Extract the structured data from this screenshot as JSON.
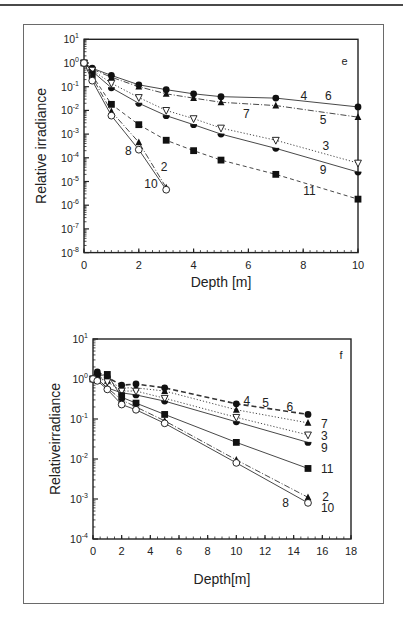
{
  "figure": {
    "panels": [
      "e",
      "f"
    ]
  },
  "chart_data": [
    {
      "type": "line",
      "panel_label": "e",
      "title": "",
      "xlabel": "Depth [m]",
      "ylabel": "Relative irradiance",
      "xlim": [
        0,
        10
      ],
      "ylim": [
        1e-08,
        10
      ],
      "yscale": "log",
      "x_ticks": [
        "0",
        "2",
        "4",
        "6",
        "8",
        "10"
      ],
      "y_ticks": [
        "10^1",
        "10^0",
        "10^-1",
        "10^-2",
        "10^-3",
        "10^-4",
        "10^-5",
        "10^-6",
        "10^-7",
        "10^-8"
      ],
      "grid": false,
      "legend": "inline curve numbers",
      "series": [
        {
          "name": "4, 6",
          "marker": "filled-circle",
          "line": "solid",
          "x": [
            0,
            0.3,
            1,
            2,
            3,
            4,
            5,
            7,
            10
          ],
          "values": [
            1,
            0.6,
            0.3,
            0.12,
            0.075,
            0.05,
            0.038,
            0.033,
            0.014
          ]
        },
        {
          "name": "5, 7",
          "marker": "filled-triangle",
          "line": "dash-dot",
          "x": [
            0,
            0.3,
            1,
            2,
            3,
            4,
            5,
            7,
            10
          ],
          "values": [
            1,
            0.55,
            0.25,
            0.1,
            0.05,
            0.033,
            0.022,
            0.016,
            0.0052
          ]
        },
        {
          "name": "3",
          "marker": "open-triangle-down",
          "line": "dotted",
          "x": [
            0,
            0.3,
            1,
            2,
            3,
            4,
            5,
            7,
            10
          ],
          "values": [
            1,
            0.5,
            0.14,
            0.035,
            0.01,
            0.0045,
            0.0018,
            0.00055,
            6e-05
          ]
        },
        {
          "name": "9",
          "marker": "half-filled-circle",
          "line": "solid",
          "x": [
            0,
            0.3,
            1,
            2,
            3,
            4,
            5,
            7,
            10
          ],
          "values": [
            1,
            0.45,
            0.09,
            0.02,
            0.006,
            0.0025,
            0.001,
            0.00025,
            2.5e-05
          ]
        },
        {
          "name": "11",
          "marker": "filled-square",
          "line": "dashed",
          "x": [
            0,
            0.3,
            1,
            2,
            3,
            4,
            5,
            7,
            10
          ],
          "values": [
            1,
            0.3,
            0.018,
            0.0025,
            0.00055,
            0.0002,
            8e-05,
            2e-05,
            1.8e-06
          ]
        },
        {
          "name": "8, 2",
          "marker": "filled-triangle",
          "line": "dash-dot",
          "x": [
            0,
            0.3,
            1,
            2,
            3
          ],
          "values": [
            1,
            0.25,
            0.009,
            0.00045,
            5.5e-06
          ]
        },
        {
          "name": "10",
          "marker": "open-circle",
          "line": "solid",
          "x": [
            0,
            0.3,
            1,
            2,
            3
          ],
          "values": [
            1,
            0.18,
            0.006,
            0.00022,
            4.5e-06
          ]
        }
      ],
      "annotations": [
        {
          "text": "e",
          "x": 9.4,
          "y": 1.2
        },
        {
          "text": "4",
          "x": 7.9,
          "y": 0.04
        },
        {
          "text": "6",
          "x": 8.8,
          "y": 0.04
        },
        {
          "text": "7",
          "x": 5.8,
          "y": 0.007
        },
        {
          "text": "5",
          "x": 8.6,
          "y": 0.004
        },
        {
          "text": "3",
          "x": 8.7,
          "y": 0.0003
        },
        {
          "text": "9",
          "x": 8.6,
          "y": 3e-05
        },
        {
          "text": "11",
          "x": 8.0,
          "y": 4e-06
        },
        {
          "text": "8",
          "x": 1.5,
          "y": 0.0002
        },
        {
          "text": "2",
          "x": 2.8,
          "y": 4e-05
        },
        {
          "text": "10",
          "x": 2.2,
          "y": 8e-06
        }
      ]
    },
    {
      "type": "line",
      "panel_label": "f",
      "title": "",
      "xlabel": "Depth[m]",
      "ylabel": "Relativeirradiance",
      "xlim": [
        0,
        18
      ],
      "ylim": [
        0.0001,
        10
      ],
      "yscale": "log",
      "x_ticks": [
        "0",
        "2",
        "4",
        "6",
        "8",
        "10",
        "12",
        "14",
        "16",
        "18"
      ],
      "y_ticks": [
        "10^1",
        "10^0",
        "10^-1",
        "10^-2",
        "10^-3",
        "10^-4"
      ],
      "grid": false,
      "legend": "inline curve numbers",
      "series": [
        {
          "name": "4, 5, 6",
          "marker": "filled-circle",
          "line": "bold-dashed",
          "x": [
            0,
            0.3,
            1,
            2,
            3,
            5,
            10,
            15
          ],
          "values": [
            1,
            1.5,
            1.1,
            0.7,
            0.75,
            0.6,
            0.24,
            0.13
          ]
        },
        {
          "name": "7",
          "marker": "filled-triangle",
          "line": "dotted",
          "x": [
            0,
            0.3,
            1,
            2,
            3,
            5,
            10,
            15
          ],
          "values": [
            1,
            1.2,
            0.9,
            0.6,
            0.6,
            0.5,
            0.17,
            0.08
          ]
        },
        {
          "name": "3",
          "marker": "open-triangle-down",
          "line": "dotted",
          "x": [
            0,
            0.3,
            1,
            2,
            3,
            5,
            10,
            15
          ],
          "values": [
            1,
            1.1,
            0.85,
            0.5,
            0.5,
            0.33,
            0.11,
            0.04
          ]
        },
        {
          "name": "9",
          "marker": "half-filled-circle",
          "line": "solid",
          "x": [
            0,
            0.3,
            1,
            2,
            3,
            5,
            10,
            15
          ],
          "values": [
            1,
            1.0,
            0.6,
            0.45,
            0.4,
            0.28,
            0.085,
            0.026
          ]
        },
        {
          "name": "11",
          "marker": "filled-square",
          "line": "solid",
          "x": [
            0,
            0.3,
            1,
            2,
            3,
            5,
            10,
            15
          ],
          "values": [
            1,
            1.2,
            1.3,
            0.35,
            0.25,
            0.13,
            0.026,
            0.0058
          ]
        },
        {
          "name": "2",
          "marker": "filled-triangle",
          "line": "dash-dot",
          "x": [
            0,
            0.3,
            1,
            2,
            3,
            5,
            10,
            15
          ],
          "values": [
            1,
            1.0,
            0.6,
            0.3,
            0.2,
            0.09,
            0.0095,
            0.0011
          ]
        },
        {
          "name": "8, 10",
          "marker": "open-circle",
          "line": "solid",
          "x": [
            0,
            0.3,
            1,
            2,
            3,
            5,
            10,
            15
          ],
          "values": [
            1,
            0.9,
            0.55,
            0.23,
            0.17,
            0.078,
            0.008,
            0.0008
          ]
        }
      ],
      "annotations": [
        {
          "text": "f",
          "x": 17.2,
          "y": 4
        },
        {
          "text": "4",
          "x": 10.5,
          "y": 0.28
        },
        {
          "text": "5",
          "x": 11.8,
          "y": 0.25
        },
        {
          "text": "6",
          "x": 13.5,
          "y": 0.2
        },
        {
          "text": "7",
          "x": 15.9,
          "y": 0.075
        },
        {
          "text": "3",
          "x": 15.9,
          "y": 0.038
        },
        {
          "text": "9",
          "x": 15.9,
          "y": 0.019
        },
        {
          "text": "11",
          "x": 15.9,
          "y": 0.0055
        },
        {
          "text": "2",
          "x": 16.0,
          "y": 0.0011
        },
        {
          "text": "8",
          "x": 13.2,
          "y": 0.0008
        },
        {
          "text": "10",
          "x": 15.9,
          "y": 0.0006
        }
      ]
    }
  ]
}
